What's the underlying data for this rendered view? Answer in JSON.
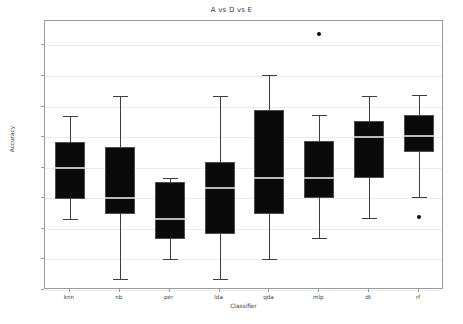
{
  "chart_data": {
    "type": "box",
    "title": "A vs D vs E",
    "xlabel": "Classifier",
    "ylabel": "Accuracy",
    "ylim": [
      0.45,
      0.89
    ],
    "grid": true,
    "legend": null,
    "ytick_labels": [
      "0.85",
      "0.80",
      "0.75",
      "0.70",
      "0.65",
      "0.60",
      "0.55",
      "0.50",
      "0.45"
    ],
    "ytick_values": [
      0.85,
      0.8,
      0.75,
      0.7,
      0.65,
      0.6,
      0.55,
      0.5,
      0.45
    ],
    "categories": [
      "knn",
      "nb",
      "per",
      "lda",
      "qda",
      "mlp",
      "dt",
      "rf"
    ],
    "boxes": [
      {
        "label": "knn",
        "whisker_low": 0.566,
        "q1": 0.599,
        "median": 0.65,
        "q3": 0.692,
        "whisker_high": 0.734,
        "outliers": []
      },
      {
        "label": "nb",
        "whisker_low": 0.468,
        "q1": 0.575,
        "median": 0.6,
        "q3": 0.684,
        "whisker_high": 0.767,
        "outliers": []
      },
      {
        "label": "per",
        "whisker_low": 0.5,
        "q1": 0.533,
        "median": 0.566,
        "q3": 0.626,
        "whisker_high": 0.634,
        "outliers": []
      },
      {
        "label": "lda",
        "whisker_low": 0.468,
        "q1": 0.541,
        "median": 0.617,
        "q3": 0.659,
        "whisker_high": 0.767,
        "outliers": []
      },
      {
        "label": "qda",
        "whisker_low": 0.501,
        "q1": 0.575,
        "median": 0.634,
        "q3": 0.744,
        "whisker_high": 0.802,
        "outliers": []
      },
      {
        "label": "mlp",
        "whisker_low": 0.535,
        "q1": 0.6,
        "median": 0.634,
        "q3": 0.693,
        "whisker_high": 0.736,
        "outliers": [
          0.868
        ]
      },
      {
        "label": "dt",
        "whisker_low": 0.568,
        "q1": 0.633,
        "median": 0.701,
        "q3": 0.727,
        "whisker_high": 0.768,
        "outliers": []
      },
      {
        "label": "rf",
        "whisker_low": 0.602,
        "q1": 0.676,
        "median": 0.702,
        "q3": 0.737,
        "whisker_high": 0.769,
        "outliers": [
          0.569
        ]
      }
    ],
    "colors": {
      "box_fill": "#0a0a0a",
      "box_edge": "#4d4d4d",
      "median": "#b9b9b9",
      "whisker": "#3d3d3d",
      "grid": "#eceaea",
      "frame": "#9a9a9a",
      "text": "#3a3a3a",
      "background": "#ffffff"
    }
  }
}
